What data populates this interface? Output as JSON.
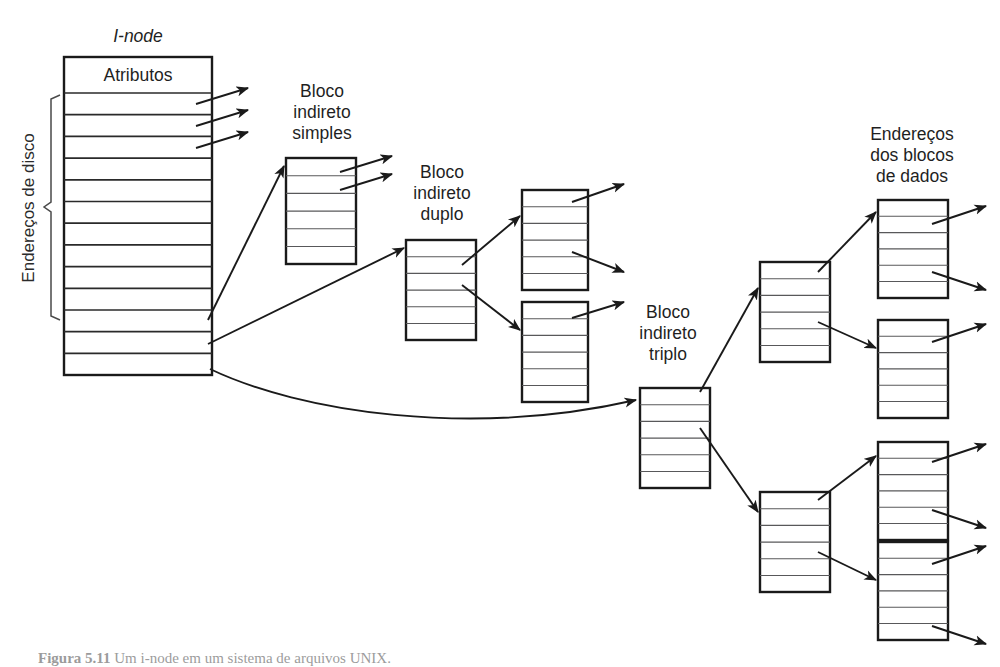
{
  "figure": {
    "domain": "diagram",
    "type": "unix-inode-block-pointer-diagram",
    "language": "pt-BR",
    "background_color": "#ffffff",
    "line_color": "#1a1a1a",
    "row_color": "#58585a"
  },
  "labels": {
    "inode_title": "I-node",
    "attributes": "Atributos",
    "disk_addresses": "Endereços de disco",
    "single_indirect": "Bloco\nindireto\nsimples",
    "single_indirect_l1": "Bloco",
    "single_indirect_l2": "indireto",
    "single_indirect_l3": "simples",
    "double_indirect_l1": "Bloco",
    "double_indirect_l2": "indireto",
    "double_indirect_l3": "duplo",
    "triple_indirect_l1": "Bloco",
    "triple_indirect_l2": "indireto",
    "triple_indirect_l3": "triplo",
    "data_block_addresses_l1": "Endereços",
    "data_block_addresses_l2": "dos blocos",
    "data_block_addresses_l3": "de dados"
  },
  "caption": {
    "prefix": "Figura 5.11",
    "text": "Um i-node em um sistema de arquivos UNIX."
  },
  "blocks": {
    "inode": {
      "name": "i-node",
      "x": 64,
      "y": 57,
      "width": 148,
      "height": 318,
      "header_label": "Atributos",
      "header_height": 36,
      "pointer_rows": 13
    },
    "single_indirect": {
      "name": "bloco-indireto-simples",
      "x": 286,
      "y": 158,
      "width": 70,
      "height": 106,
      "rows": 6
    },
    "double_indirect": {
      "name": "bloco-indireto-duplo",
      "x": 406,
      "y": 240,
      "width": 70,
      "height": 100,
      "rows": 6
    },
    "double_child_top": {
      "name": "bloco-filho-duplo-superior",
      "x": 522,
      "y": 190,
      "width": 66,
      "height": 100,
      "rows": 6
    },
    "double_child_bottom": {
      "name": "bloco-filho-duplo-inferior",
      "x": 522,
      "y": 302,
      "width": 66,
      "height": 100,
      "rows": 6
    },
    "triple_indirect": {
      "name": "bloco-indireto-triplo",
      "x": 640,
      "y": 388,
      "width": 70,
      "height": 100,
      "rows": 6
    },
    "triple_child_top": {
      "name": "bloco-filho-triplo-superior",
      "x": 760,
      "y": 262,
      "width": 70,
      "height": 100,
      "rows": 6
    },
    "triple_child_bottom": {
      "name": "bloco-filho-triplo-inferior",
      "x": 760,
      "y": 492,
      "width": 70,
      "height": 100,
      "rows": 6
    },
    "data_addr_1": {
      "name": "bloco-enderecos-dados-1",
      "x": 878,
      "y": 200,
      "width": 70,
      "height": 98,
      "rows": 6
    },
    "data_addr_2": {
      "name": "bloco-enderecos-dados-2",
      "x": 878,
      "y": 320,
      "width": 70,
      "height": 98,
      "rows": 6
    },
    "data_addr_3": {
      "name": "bloco-enderecos-dados-3",
      "x": 878,
      "y": 442,
      "width": 70,
      "height": 98,
      "rows": 6
    },
    "data_addr_4": {
      "name": "bloco-enderecos-dados-4",
      "x": 878,
      "y": 542,
      "width": 70,
      "height": 98,
      "rows": 6
    }
  },
  "arrows": {
    "inode_direct_out": 3,
    "inode_to_single": 1,
    "inode_to_double": 1,
    "inode_to_triple": 1,
    "single_out": 2,
    "double_to_children": 2,
    "double_children_out": 3,
    "triple_to_children": 2,
    "triple_children_to_data": 4,
    "data_out": 7
  }
}
